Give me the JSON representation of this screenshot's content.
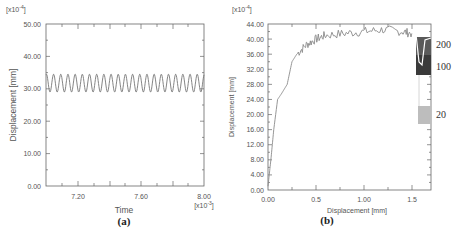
{
  "chart_data": [
    {
      "type": "line",
      "panel": "(a)",
      "title": "",
      "xlabel": "Time",
      "ylabel": "Displacement [mm]",
      "x_multiplier": "[x10^-3]",
      "y_multiplier": "[x10^-4]",
      "xlim": [
        7.0,
        8.0
      ],
      "ylim": [
        0.0,
        50.0
      ],
      "x_ticks": [
        "7.20",
        "7.60",
        "8.00"
      ],
      "y_ticks": [
        "0.00",
        "10.00",
        "20.00",
        "30.00",
        "40.00",
        "50.00"
      ],
      "grid": false,
      "series": [
        {
          "name": "displacement",
          "description": "sinusoidal oscillation, ~22 cycles",
          "min": 29.0,
          "max": 34.5,
          "mean": 31.8,
          "cycles": 22
        }
      ]
    },
    {
      "type": "line",
      "panel": "(b)",
      "title": "",
      "xlabel": "Displacement [mm]",
      "ylabel": "Displacement [mm]",
      "y_multiplier": "[x10^-4]",
      "xlim": [
        0.0,
        1.7
      ],
      "ylim": [
        0.0,
        44.0
      ],
      "x_ticks": [
        "0.00",
        "0.5",
        "1.00",
        "1.5"
      ],
      "y_ticks": [
        "0.00",
        "4.00",
        "8.00",
        "12.00",
        "16.00",
        "20.00",
        "24.00",
        "28.00",
        "32.00",
        "36.00",
        "40.00",
        "44.00"
      ],
      "grid": false,
      "series": [
        {
          "name": "main curve",
          "x": [
            0.0,
            0.03,
            0.06,
            0.1,
            0.14,
            0.2,
            0.25,
            0.3,
            0.4,
            0.5,
            0.6,
            0.8,
            1.0,
            1.2,
            1.4,
            1.5
          ],
          "y": [
            1.0,
            8.0,
            16.0,
            24.0,
            25.5,
            28.0,
            34.0,
            36.0,
            38.5,
            40.0,
            41.0,
            41.5,
            42.0,
            42.5,
            42.0,
            41.5
          ]
        },
        {
          "name": "200",
          "band_x": [
            1.55,
            1.7
          ],
          "band_y": [
            30.5,
            41.0
          ]
        },
        {
          "name": "100",
          "band_x": [
            1.55,
            1.7
          ],
          "band_y": [
            30.5,
            36.0
          ]
        },
        {
          "name": "20",
          "band_x": [
            1.56,
            1.7
          ],
          "band_y": [
            17.0,
            22.0
          ]
        }
      ],
      "legend_entries": [
        "200",
        "100",
        "20"
      ],
      "legend_position": "right"
    }
  ],
  "panel_a": {
    "y_multiplier": "[x10",
    "y_multiplier_exp": "-4",
    "y_multiplier_close": "]",
    "x_multiplier": "[x10",
    "x_multiplier_exp": "-3",
    "x_multiplier_close": "]",
    "xlabel": "Time",
    "ylabel": "Displacement [mm]",
    "x_ticks": [
      "7.20",
      "7.60",
      "8.00"
    ],
    "y_ticks": [
      "0.00",
      "10.00",
      "20.00",
      "30.00",
      "40.00",
      "50.00"
    ],
    "label": "(a)"
  },
  "panel_b": {
    "y_multiplier": "[x10",
    "y_multiplier_exp": "-4",
    "y_multiplier_close": "]",
    "xlabel": "Displacement [mm]",
    "ylabel": "Displacement [mm]",
    "x_ticks": [
      "0.00",
      "0.5",
      "1.00",
      "1.5"
    ],
    "y_ticks": [
      "0.00",
      "4.00",
      "8.00",
      "12.00",
      "16.00",
      "20.00",
      "24.00",
      "28.00",
      "32.00",
      "36.00",
      "40.00",
      "44.00"
    ],
    "legend": [
      "200",
      "100",
      "20"
    ],
    "label": "(b)",
    "colors": {
      "line": "#888888",
      "band_200": "#555555",
      "band_100": "#3a3a3a",
      "band_20": "#b8b8b8"
    }
  }
}
